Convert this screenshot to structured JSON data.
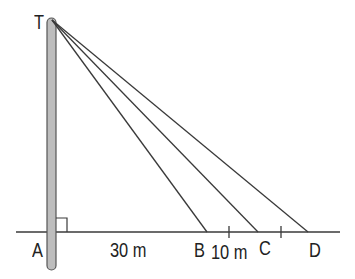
{
  "diagram": {
    "points": {
      "T": "T",
      "A": "A",
      "B": "B",
      "C": "C",
      "D": "D"
    },
    "measurements": {
      "AB": "30 m",
      "BC": "10 m"
    },
    "colors": {
      "line": "#3a3a3a",
      "pole_fill": "#bdbdbd",
      "pole_stroke": "#555555"
    }
  }
}
